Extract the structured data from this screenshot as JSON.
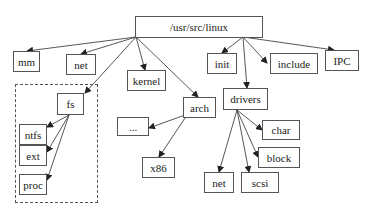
{
  "diagram": {
    "type": "tree",
    "group": {
      "label": "fs-subtree",
      "x": 15,
      "y": 84,
      "w": 83,
      "h": 119
    },
    "nodes": [
      {
        "id": "root",
        "label": "/usr/src/linux",
        "x": 135,
        "y": 16,
        "w": 128,
        "h": 22
      },
      {
        "id": "mm",
        "label": "mm",
        "x": 13,
        "y": 51,
        "w": 27,
        "h": 21
      },
      {
        "id": "net",
        "label": "net",
        "x": 66,
        "y": 54,
        "w": 30,
        "h": 21
      },
      {
        "id": "kernel",
        "label": "kernel",
        "x": 127,
        "y": 70,
        "w": 39,
        "h": 21
      },
      {
        "id": "init",
        "label": "init",
        "x": 207,
        "y": 53,
        "w": 30,
        "h": 21
      },
      {
        "id": "include",
        "label": "include",
        "x": 270,
        "y": 53,
        "w": 48,
        "h": 21
      },
      {
        "id": "IPC",
        "label": "IPC",
        "x": 325,
        "y": 50,
        "w": 34,
        "h": 21
      },
      {
        "id": "fs",
        "label": "fs",
        "x": 57,
        "y": 93,
        "w": 27,
        "h": 22
      },
      {
        "id": "ntfs",
        "label": "ntfs",
        "x": 19,
        "y": 124,
        "w": 28,
        "h": 21
      },
      {
        "id": "ext",
        "label": "ext",
        "x": 19,
        "y": 145,
        "w": 28,
        "h": 21
      },
      {
        "id": "proc",
        "label": "proc",
        "x": 19,
        "y": 174,
        "w": 28,
        "h": 21
      },
      {
        "id": "arch",
        "label": "arch",
        "x": 183,
        "y": 97,
        "w": 33,
        "h": 21
      },
      {
        "id": "drivers",
        "label": "drivers",
        "x": 223,
        "y": 88,
        "w": 45,
        "h": 22
      },
      {
        "id": "ellipsis",
        "label": "...",
        "x": 117,
        "y": 117,
        "w": 32,
        "h": 19
      },
      {
        "id": "x86",
        "label": "x86",
        "x": 142,
        "y": 157,
        "w": 33,
        "h": 21
      },
      {
        "id": "char",
        "label": "char",
        "x": 262,
        "y": 120,
        "w": 38,
        "h": 20
      },
      {
        "id": "block",
        "label": "block",
        "x": 258,
        "y": 147,
        "w": 42,
        "h": 21
      },
      {
        "id": "dnet",
        "label": "net",
        "x": 204,
        "y": 172,
        "w": 30,
        "h": 21
      },
      {
        "id": "scsi",
        "label": "scsi",
        "x": 241,
        "y": 172,
        "w": 38,
        "h": 21
      }
    ],
    "edges": [
      {
        "from": [
          136,
          37
        ],
        "to": [
          27,
          51
        ]
      },
      {
        "from": [
          136,
          37
        ],
        "to": [
          81,
          54
        ]
      },
      {
        "from": [
          136,
          37
        ],
        "to": [
          145,
          70
        ]
      },
      {
        "from": [
          136,
          37
        ],
        "to": [
          85,
          93
        ]
      },
      {
        "from": [
          136,
          37
        ],
        "to": [
          198,
          97
        ]
      },
      {
        "from": [
          243,
          37
        ],
        "to": [
          222,
          53
        ]
      },
      {
        "from": [
          243,
          37
        ],
        "to": [
          247,
          88
        ]
      },
      {
        "from": [
          243,
          37
        ],
        "to": [
          267,
          63
        ]
      },
      {
        "from": [
          243,
          37
        ],
        "to": [
          334,
          50
        ]
      },
      {
        "from": [
          69,
          115
        ],
        "to": [
          47,
          127
        ]
      },
      {
        "from": [
          69,
          115
        ],
        "to": [
          47,
          152
        ]
      },
      {
        "from": [
          69,
          115
        ],
        "to": [
          47,
          180
        ]
      },
      {
        "from": [
          185,
          115
        ],
        "to": [
          149,
          128
        ]
      },
      {
        "from": [
          187,
          115
        ],
        "to": [
          159,
          157
        ]
      },
      {
        "from": [
          237,
          110
        ],
        "to": [
          262,
          130
        ]
      },
      {
        "from": [
          237,
          110
        ],
        "to": [
          258,
          157
        ]
      },
      {
        "from": [
          237,
          110
        ],
        "to": [
          219,
          172
        ]
      },
      {
        "from": [
          237,
          110
        ],
        "to": [
          249,
          172
        ]
      }
    ]
  },
  "colors": {
    "stroke": "#444444",
    "text": "#222222",
    "background": "#ffffff"
  }
}
